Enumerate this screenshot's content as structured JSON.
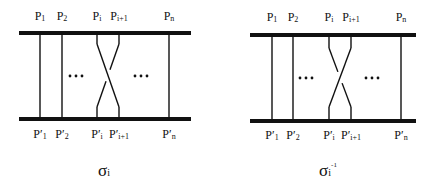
{
  "colors": {
    "ink": "#111111",
    "background": "#ffffff"
  },
  "diagrams": [
    {
      "id": "sigma-i",
      "caption": {
        "base": "σ",
        "sub": "i",
        "sup": ""
      },
      "caption_x": 104,
      "bar": {
        "x1": 19,
        "x2": 191,
        "top_y": 33,
        "bottom_y": 119,
        "thickness": 4
      },
      "top_labels": [
        {
          "base": "P",
          "sub": "1",
          "x": 40
        },
        {
          "base": "P",
          "sub": "2",
          "x": 62
        },
        {
          "base": "P",
          "sub": "i",
          "x": 97
        },
        {
          "base": "P",
          "sub": "i+1",
          "x": 119
        },
        {
          "base": "P",
          "sub": "n",
          "x": 169
        }
      ],
      "bottom_labels": [
        {
          "base": "P′",
          "sub": "1",
          "x": 40
        },
        {
          "base": "P′",
          "sub": "2",
          "x": 62
        },
        {
          "base": "P′",
          "sub": "i",
          "x": 97
        },
        {
          "base": "P′",
          "sub": "i+1",
          "x": 119
        },
        {
          "base": "P′",
          "sub": "n",
          "x": 169
        }
      ],
      "straight_strands_x": [
        40,
        62,
        169
      ],
      "crossing": {
        "left_x": 97,
        "right_x": 119,
        "bend_top_y": 54,
        "bend_bottom_y": 97,
        "over": "left-to-right"
      },
      "ellipses": [
        {
          "x": 76,
          "y": 76,
          "text": "···"
        },
        {
          "x": 141,
          "y": 76,
          "text": "···"
        }
      ]
    },
    {
      "id": "sigma-i-inverse",
      "caption": {
        "base": "σ",
        "sub": "i",
        "sup": "-1"
      },
      "caption_x": 328,
      "bar": {
        "x1": 250,
        "x2": 416,
        "top_y": 35,
        "bottom_y": 121,
        "thickness": 4
      },
      "top_labels": [
        {
          "base": "P",
          "sub": "1",
          "x": 272
        },
        {
          "base": "P",
          "sub": "2",
          "x": 293
        },
        {
          "base": "P",
          "sub": "i",
          "x": 329
        },
        {
          "base": "P",
          "sub": "i+1",
          "x": 351
        },
        {
          "base": "P",
          "sub": "n",
          "x": 401
        }
      ],
      "bottom_labels": [
        {
          "base": "P′",
          "sub": "1",
          "x": 272
        },
        {
          "base": "P′",
          "sub": "2",
          "x": 293
        },
        {
          "base": "P′",
          "sub": "i",
          "x": 329
        },
        {
          "base": "P′",
          "sub": "i+1",
          "x": 351
        },
        {
          "base": "P′",
          "sub": "n",
          "x": 401
        }
      ],
      "straight_strands_x": [
        272,
        293,
        401
      ],
      "crossing": {
        "left_x": 329,
        "right_x": 351,
        "bend_top_y": 58,
        "bend_bottom_y": 97,
        "over": "right-to-left"
      },
      "ellipses": [
        {
          "x": 306,
          "y": 78,
          "text": "···"
        },
        {
          "x": 372,
          "y": 78,
          "text": "···"
        }
      ]
    }
  ]
}
